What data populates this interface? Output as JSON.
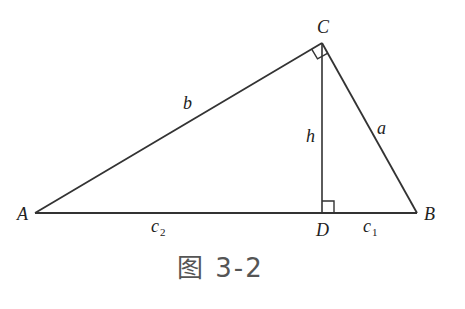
{
  "figure": {
    "caption": "图 3-2",
    "line_color": "#333333",
    "vertices": {
      "A": {
        "label": "A",
        "x": 35,
        "y": 213
      },
      "B": {
        "label": "B",
        "x": 417,
        "y": 213
      },
      "C": {
        "label": "C",
        "x": 322,
        "y": 43
      },
      "D": {
        "label": "D",
        "x": 322,
        "y": 213
      }
    },
    "sides": {
      "a": "a",
      "b": "b",
      "h": "h",
      "c1": {
        "base": "c",
        "sub": "1"
      },
      "c2": {
        "base": "c",
        "sub": "2"
      }
    },
    "right_angles": [
      "C",
      "D"
    ]
  }
}
